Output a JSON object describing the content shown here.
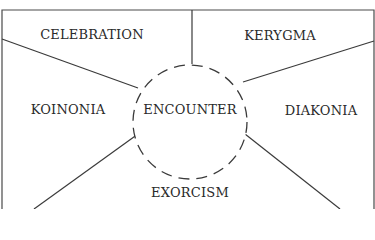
{
  "diagram": {
    "center": {
      "label": "ENCOUNTER"
    },
    "regions": [
      {
        "id": "celebration",
        "label": "CELEBRATION",
        "x": 92,
        "y": 34
      },
      {
        "id": "kerygma",
        "label": "KERYGMA",
        "x": 280,
        "y": 35
      },
      {
        "id": "koinonia",
        "label": "KOINONIA",
        "x": 68,
        "y": 109
      },
      {
        "id": "diakonia",
        "label": "DIAKONIA",
        "x": 321,
        "y": 110
      },
      {
        "id": "exorcism",
        "label": "EXORCISM",
        "x": 190,
        "y": 192
      }
    ],
    "colors": {
      "line": "#3a3a3a",
      "text": "#2a2a2a",
      "background": "#ffffff"
    }
  }
}
